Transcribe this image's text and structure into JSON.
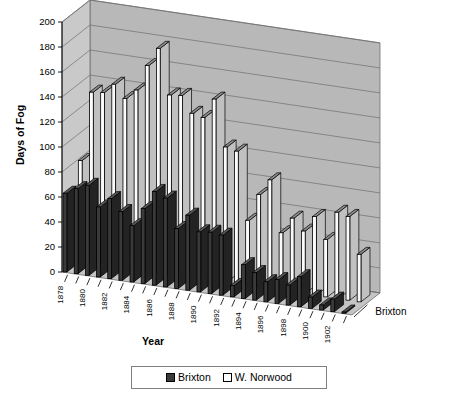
{
  "chart_data": {
    "type": "bar",
    "title": "",
    "xlabel": "Year",
    "ylabel": "Days of Fog",
    "zlabel": "Brixton",
    "ylim": [
      0,
      200
    ],
    "ytick_interval": 20,
    "yticks": [
      "0",
      "20",
      "40",
      "60",
      "80",
      "100",
      "120",
      "140",
      "160",
      "180",
      "200"
    ],
    "grid": true,
    "legend_position": "bottom",
    "three_d": true,
    "categories": [
      "1878",
      "1879",
      "1880",
      "1881",
      "1882",
      "1883",
      "1884",
      "1885",
      "1886",
      "1887",
      "1888",
      "1889",
      "1890",
      "1891",
      "1892",
      "1893",
      "1894",
      "1895",
      "1896",
      "1897",
      "1898",
      "1899",
      "1900",
      "1901",
      "1902",
      "1903"
    ],
    "xtick_labels_shown": [
      "1878",
      "1880",
      "1882",
      "1884",
      "1886",
      "1888",
      "1890",
      "1892",
      "1894",
      "1896",
      "1898",
      "1900",
      "1902"
    ],
    "series": [
      {
        "name": "Brixton",
        "color": "#3a3a3a",
        "values": [
          63,
          68,
          72,
          56,
          64,
          55,
          45,
          60,
          75,
          71,
          48,
          60,
          48,
          49,
          48,
          9,
          27,
          22,
          16,
          19,
          16,
          24,
          9,
          4,
          10,
          1
        ]
      },
      {
        "name": "W. Norwood",
        "color": "#ffffff",
        "values": [
          80,
          136,
          137,
          145,
          135,
          143,
          164,
          179,
          143,
          144,
          131,
          129,
          145,
          108,
          106,
          52,
          74,
          87,
          46,
          59,
          50,
          63,
          46,
          69,
          67,
          38
        ]
      }
    ]
  },
  "legend": {
    "entries": [
      {
        "label": "Brixton",
        "swatch": "dark"
      },
      {
        "label": "W. Norwood",
        "swatch": "light"
      }
    ]
  },
  "axes": {
    "y_title": "Days of Fog",
    "x_title": "Year",
    "z_series_label": "Brixton"
  },
  "colors": {
    "wall": "#b8b8b8",
    "wall_side": "#c9c9c9",
    "floor": "#c4c4c4",
    "grid_line": "#6e6e6e",
    "bar_dark": "#3a3a3a",
    "bar_dark_side": "#232323",
    "bar_dark_top": "#585858",
    "bar_light": "#fbfbfb",
    "bar_light_side": "#c0c0c0",
    "bar_light_top": "#8c8c8c",
    "outline": "#000000"
  }
}
